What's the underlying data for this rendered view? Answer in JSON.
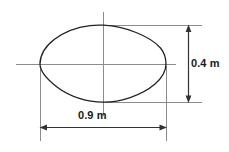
{
  "figure": {
    "type": "engineering-dimension-drawing",
    "background_color": "#ffffff",
    "outline_color": "#222222",
    "centerline_color": "#808080",
    "dimension_color": "#333333",
    "shape": {
      "name": "lens-outline",
      "center_x": 103,
      "center_y": 64,
      "left_vertex_x": 40,
      "right_vertex_x": 166,
      "top_vertex_y": 25,
      "bottom_vertex_y": 102,
      "pixel_width": 126,
      "pixel_height": 77
    },
    "centerlines": {
      "horizontal": {
        "x1": 16,
        "y1": 64,
        "x2": 176,
        "y2": 64
      },
      "vertical": {
        "x1": 103,
        "y1": 12,
        "x2": 103,
        "y2": 116
      }
    },
    "dimensions": [
      {
        "name": "height-dimension",
        "label": "0.4 m",
        "value": 0.4,
        "unit": "m",
        "orientation": "vertical",
        "line_x": 188,
        "from_y": 25,
        "to_y": 102,
        "extension_top": {
          "x1": 105,
          "y1": 25,
          "x2": 202,
          "y2": 25
        },
        "extension_bottom": {
          "x1": 105,
          "y1": 102,
          "x2": 202,
          "y2": 102
        }
      },
      {
        "name": "width-dimension",
        "label": "0.9 m",
        "value": 0.9,
        "unit": "m",
        "orientation": "horizontal",
        "line_y": 127,
        "from_x": 40,
        "to_x": 166,
        "extension_left": {
          "x1": 40,
          "y1": 66,
          "x2": 40,
          "y2": 141
        },
        "extension_right": {
          "x1": 166,
          "y1": 66,
          "x2": 166,
          "y2": 141
        }
      }
    ]
  }
}
